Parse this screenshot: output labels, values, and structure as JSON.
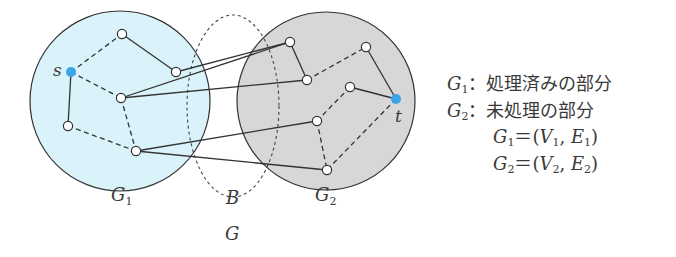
{
  "diagram": {
    "colors": {
      "g1_fill": "#daf2f9",
      "g2_fill": "#d7d7d7",
      "stroke": "#333333",
      "terminal": "#3aa6e8",
      "node_fill": "#ffffff"
    },
    "regions": {
      "g1": {
        "label": "G",
        "sub": "1"
      },
      "g2": {
        "label": "G",
        "sub": "2"
      },
      "boundary": {
        "label": "B"
      },
      "whole": {
        "label": "G"
      }
    },
    "terminals": {
      "source": {
        "label": "s"
      },
      "target": {
        "label": "t"
      }
    },
    "nodes": [
      {
        "id": "s",
        "x": 71,
        "y": 72,
        "terminal": true
      },
      {
        "id": "a1",
        "x": 122,
        "y": 34
      },
      {
        "id": "a2",
        "x": 176,
        "y": 72
      },
      {
        "id": "a3",
        "x": 121,
        "y": 98
      },
      {
        "id": "a4",
        "x": 68,
        "y": 126
      },
      {
        "id": "a5",
        "x": 136,
        "y": 151
      },
      {
        "id": "b1",
        "x": 290,
        "y": 42
      },
      {
        "id": "b2",
        "x": 307,
        "y": 80
      },
      {
        "id": "b3",
        "x": 366,
        "y": 47
      },
      {
        "id": "b4",
        "x": 350,
        "y": 87
      },
      {
        "id": "b5",
        "x": 317,
        "y": 121
      },
      {
        "id": "b6",
        "x": 327,
        "y": 170
      },
      {
        "id": "t",
        "x": 396,
        "y": 99,
        "terminal": true
      }
    ],
    "edges": [
      {
        "from": "s",
        "to": "a1",
        "style": "dashed"
      },
      {
        "from": "a1",
        "to": "a2",
        "style": "solid"
      },
      {
        "from": "s",
        "to": "a3",
        "style": "dashed"
      },
      {
        "from": "s",
        "to": "a4",
        "style": "solid"
      },
      {
        "from": "a4",
        "to": "a5",
        "style": "dashed"
      },
      {
        "from": "a3",
        "to": "a5",
        "style": "dashed"
      },
      {
        "from": "a2",
        "to": "b1",
        "style": "solid"
      },
      {
        "from": "a3",
        "to": "b1",
        "style": "solid"
      },
      {
        "from": "a3",
        "to": "b2",
        "style": "solid"
      },
      {
        "from": "a5",
        "to": "b5",
        "style": "solid"
      },
      {
        "from": "a5",
        "to": "b6",
        "style": "solid"
      },
      {
        "from": "b1",
        "to": "b2",
        "style": "solid"
      },
      {
        "from": "b2",
        "to": "b3",
        "style": "dashed"
      },
      {
        "from": "b3",
        "to": "t",
        "style": "solid"
      },
      {
        "from": "b4",
        "to": "t",
        "style": "solid"
      },
      {
        "from": "b4",
        "to": "b5",
        "style": "dashed"
      },
      {
        "from": "b5",
        "to": "b6",
        "style": "dashed"
      },
      {
        "from": "t",
        "to": "b6",
        "style": "dashed"
      }
    ]
  },
  "legend": {
    "line1": {
      "var": "G",
      "sub": "1",
      "sep": "：",
      "text": "処理済みの部分"
    },
    "line2": {
      "var": "G",
      "sub": "2",
      "sep": "：",
      "text": "未処理の部分"
    },
    "line3": {
      "lhs_var": "G",
      "lhs_sub": "1",
      "eq": "＝",
      "open": "(",
      "v": "V",
      "v_sub": "1",
      "comma": ", ",
      "e": "E",
      "e_sub": "1",
      "close": ")"
    },
    "line4": {
      "lhs_var": "G",
      "lhs_sub": "2",
      "eq": "＝",
      "open": "(",
      "v": "V",
      "v_sub": "2",
      "comma": ", ",
      "e": "E",
      "e_sub": "2",
      "close": ")"
    }
  }
}
